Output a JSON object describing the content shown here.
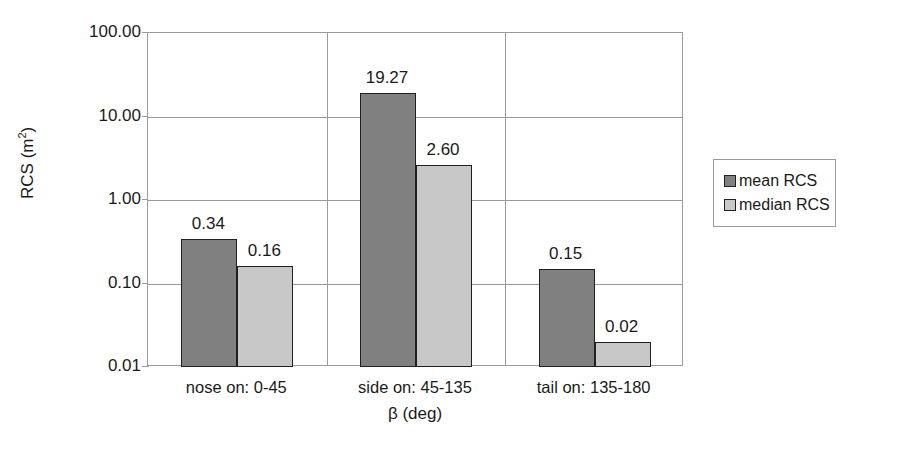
{
  "chart_data": {
    "type": "bar",
    "title": "",
    "xlabel": "β (deg)",
    "ylabel": "RCS (m2)",
    "ylabel_base": "RCS (m",
    "ylabel_sup": "2",
    "ylabel_tail": ")",
    "categories": [
      "nose on:  0-45",
      "side on: 45-135",
      "tail on: 135-180"
    ],
    "series": [
      {
        "name": "mean RCS",
        "values": [
          0.34,
          19.27,
          0.15
        ],
        "color": "#808080"
      },
      {
        "name": "median RCS",
        "values": [
          0.16,
          2.6,
          0.02
        ],
        "color": "#c8c8c8"
      }
    ],
    "value_labels": [
      [
        "0.34",
        "0.16"
      ],
      [
        "19.27",
        "2.60"
      ],
      [
        "0.15",
        "0.02"
      ]
    ],
    "yscale": "log",
    "ylim": [
      0.01,
      100
    ],
    "yticks": [
      100,
      10,
      1,
      0.1,
      0.01
    ],
    "ytick_labels": [
      "100.00",
      "10.00",
      "1.00",
      "0.10",
      "0.01"
    ],
    "grid": "horizontal-and-category-separators",
    "legend_position": "right"
  },
  "legend": {
    "items": [
      {
        "label": "mean RCS"
      },
      {
        "label": "median RCS"
      }
    ]
  }
}
